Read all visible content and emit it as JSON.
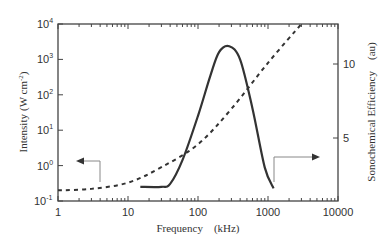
{
  "chart_data": {
    "type": "line",
    "title": "",
    "xlabel": "Frequency (kHz)",
    "ylabel": "Intensity (W cm⁻²)",
    "y2label": "Sonochemical Efficiency (au)",
    "xscale": "log",
    "yscale": "log",
    "xlim": [
      1,
      10000
    ],
    "ylim": [
      0.1,
      10000
    ],
    "y2lim": [
      0,
      13
    ],
    "x_ticks": [
      "1",
      "10",
      "100",
      "1000",
      "10000"
    ],
    "y_ticks": [
      "10^-1",
      "10^0",
      "10^1",
      "10^2",
      "10^3",
      "10^4"
    ],
    "y2_ticks": [
      "5",
      "10"
    ],
    "grid": false,
    "legend": "none",
    "series": [
      {
        "name": "Intensity (cavitation threshold)",
        "style": "dashed",
        "axis": "left",
        "x": [
          1,
          3,
          10,
          30,
          100,
          300,
          1000,
          3000
        ],
        "y": [
          0.2,
          0.22,
          0.33,
          0.9,
          4,
          40,
          800,
          10000
        ]
      },
      {
        "name": "Sonochemical Efficiency",
        "style": "solid",
        "axis": "right",
        "x": [
          15,
          30,
          40,
          60,
          100,
          150,
          200,
          280,
          400,
          600,
          900,
          1200
        ],
        "y": [
          1.7,
          1.7,
          1.9,
          3.5,
          6.5,
          9.2,
          10.8,
          11.2,
          10.3,
          7.0,
          3.0,
          1.6
        ]
      }
    ],
    "annotations": [
      {
        "type": "arrow",
        "direction": "left",
        "note": "dashed curve refers to left axis"
      },
      {
        "type": "arrow",
        "direction": "right",
        "note": "solid curve refers to right axis"
      }
    ]
  },
  "labels": {
    "xlabel": "Frequency　(kHz)",
    "ylabel_main": "Intensity",
    "ylabel_unit": "(W  cm",
    "ylabel_exp": "-2",
    "ylabel_close": ")",
    "y2label": "Sonochemical Efficiency　(au)",
    "x_ticks": [
      "1",
      "10",
      "100",
      "1000",
      "10000"
    ],
    "y_ticks_base": "10",
    "y_ticks_exp": [
      "4",
      "3",
      "2",
      "1",
      "0",
      "-1"
    ],
    "y2_ticks": [
      "10",
      "5"
    ]
  }
}
